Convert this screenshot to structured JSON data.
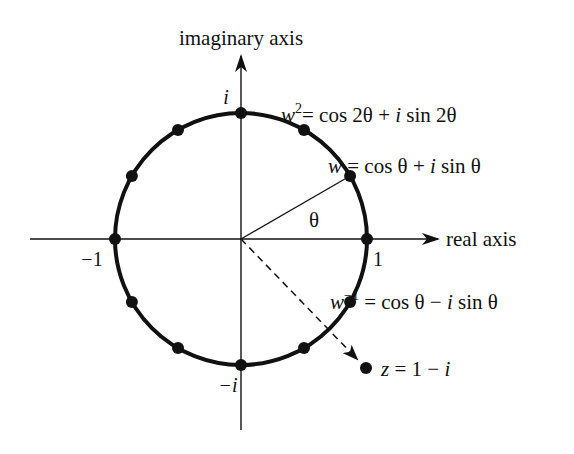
{
  "diagram": {
    "axes": {
      "real_label": "real axis",
      "imaginary_label": "imaginary axis",
      "tick_labels": {
        "pos_real": "1",
        "neg_real": "−1",
        "pos_imag": "i",
        "neg_imag": "−i"
      }
    },
    "angle_label": "θ",
    "annotations": {
      "w_squared": {
        "lhs": "w",
        "sup": "2",
        "rhs": "= cos 2θ + ",
        "i": "i",
        "rest": " sin 2θ"
      },
      "w": {
        "lhs": "w",
        "rhs": " = cos θ + ",
        "i": "i",
        "rest": " sin θ"
      },
      "w_inverse": {
        "lhs": "w",
        "sup": "−1",
        "rhs": " = cos θ − ",
        "i": "i",
        "rest": " sin θ"
      },
      "z": {
        "lhs": "z",
        "rhs": " = 1 − ",
        "i": "i"
      }
    },
    "unit_circle_points_degrees": [
      0,
      30,
      60,
      90,
      120,
      150,
      180,
      210,
      240,
      270,
      300,
      330
    ],
    "highlighted_point": {
      "label": "z = 1 − i",
      "re": 1,
      "im": -1
    },
    "colors": {
      "ink": "#111111",
      "background": "#ffffff"
    }
  }
}
